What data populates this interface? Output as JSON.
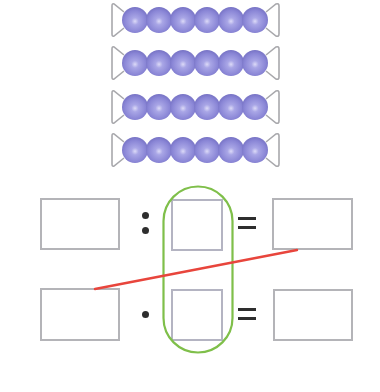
{
  "diagram": {
    "bead_rows": {
      "count": 4,
      "beads_per_row": 6,
      "row_centers_y": [
        20,
        63,
        107,
        150
      ],
      "bead_color": "#8a86d6",
      "bead_highlight": "#c7c5f0",
      "wire_color": "#a8a8ac"
    },
    "equations": [
      {
        "row": "top",
        "operator": "division",
        "operator_symbol": ":",
        "equals_symbol": "=",
        "boxes": [
          {
            "id": "dividend",
            "value": ""
          },
          {
            "id": "divisor",
            "value": ""
          },
          {
            "id": "quotient",
            "value": ""
          }
        ]
      },
      {
        "row": "bottom",
        "operator": "multiplication",
        "operator_symbol": "·",
        "equals_symbol": "=",
        "boxes": [
          {
            "id": "factor-1",
            "value": ""
          },
          {
            "id": "factor-2",
            "value": ""
          },
          {
            "id": "product",
            "value": ""
          }
        ]
      }
    ],
    "highlight_loop_color": "#7fbf4a",
    "connector_line_color": "#e8453c"
  }
}
